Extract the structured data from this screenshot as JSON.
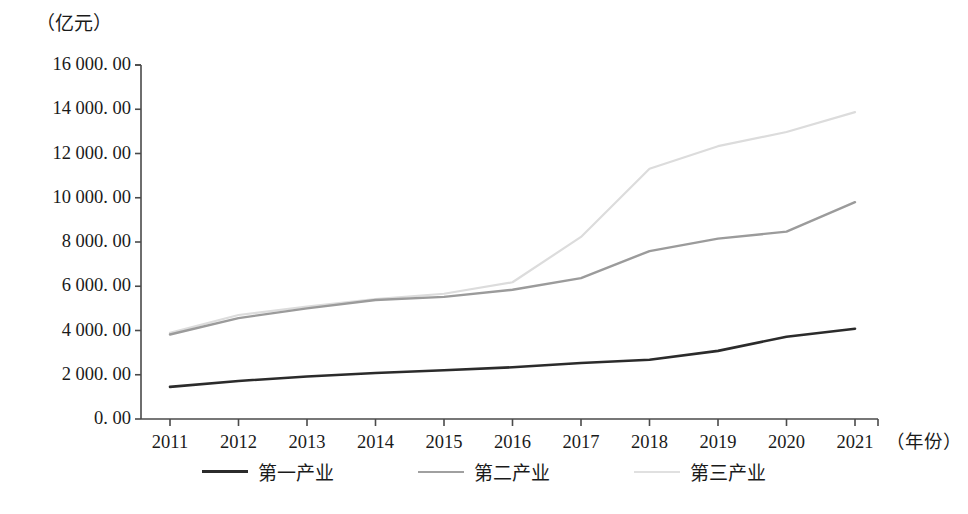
{
  "chart_data": {
    "type": "line",
    "title": "",
    "subtitle": "",
    "xlabel": "（年份）",
    "ylabel": "（亿元）",
    "categories": [
      "2011",
      "2012",
      "2013",
      "2014",
      "2015",
      "2016",
      "2017",
      "2018",
      "2019",
      "2020",
      "2021"
    ],
    "x": [
      2011,
      2012,
      2013,
      2014,
      2015,
      2016,
      2017,
      2018,
      2019,
      2020,
      2021
    ],
    "ylim": [
      0,
      16000
    ],
    "ytick_values": [
      0,
      2000,
      4000,
      6000,
      8000,
      10000,
      12000,
      14000,
      16000
    ],
    "ytick_labels": [
      "0. 00",
      "2 000. 00",
      "4 000. 00",
      "6 000. 00",
      "8 000. 00",
      "10 000. 00",
      "12 000. 00",
      "14 000. 00",
      "16 000. 00"
    ],
    "grid": false,
    "legend_position": "bottom",
    "series": [
      {
        "name": "第一产业",
        "color": "#2b2b2b",
        "width": 2.6,
        "values": [
          1450,
          1720,
          1920,
          2080,
          2200,
          2340,
          2530,
          2680,
          3080,
          3720,
          4080
        ]
      },
      {
        "name": "第二产业",
        "color": "#9b9b9b",
        "width": 2.4,
        "values": [
          3820,
          4560,
          5000,
          5380,
          5520,
          5840,
          6370,
          7590,
          8150,
          8470,
          9800
        ]
      },
      {
        "name": "第三产业",
        "color": "#dcdcdc",
        "width": 2.2,
        "values": [
          3890,
          4700,
          5080,
          5420,
          5660,
          6180,
          8230,
          11310,
          12330,
          12970,
          13870
        ]
      }
    ]
  },
  "axes": {
    "line_color": "#4a4a4a",
    "tick_color": "#4a4a4a"
  },
  "legend": {
    "items": [
      {
        "label": "第一产业",
        "color": "#2b2b2b",
        "width": 3.4
      },
      {
        "label": "第二产业",
        "color": "#a0a0a0",
        "width": 2.8
      },
      {
        "label": "第三产业",
        "color": "#e0e0e0",
        "width": 2.4
      }
    ]
  }
}
